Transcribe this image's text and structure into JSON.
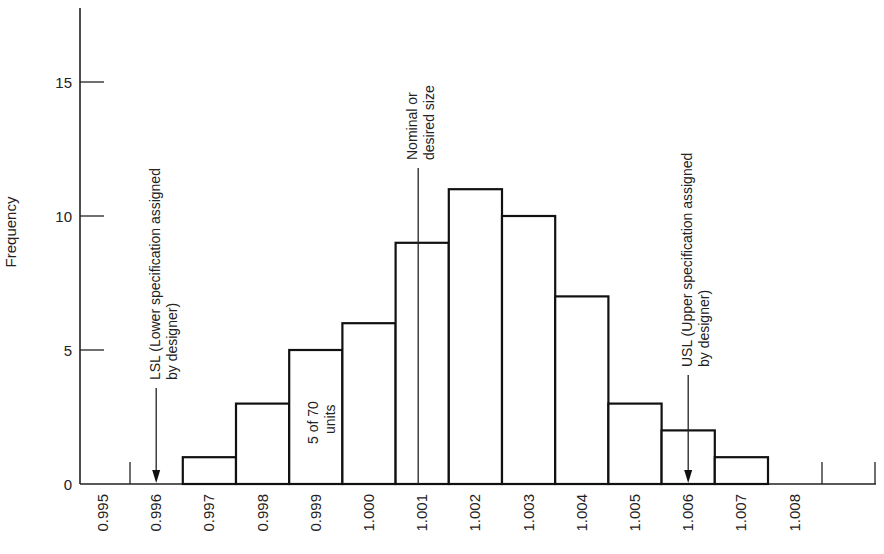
{
  "chart_data": {
    "type": "bar",
    "subtype": "histogram",
    "title": "",
    "xlabel": "",
    "ylabel": "Frequency",
    "ylim": [
      0,
      18
    ],
    "yticks": [
      0,
      5,
      10,
      15
    ],
    "categories": [
      "0.995",
      "0.996",
      "0.997",
      "0.998",
      "0.999",
      "1.000",
      "1.001",
      "1.002",
      "1.003",
      "1.004",
      "1.005",
      "1.006",
      "1.007",
      "1.008"
    ],
    "values": [
      0,
      0,
      1,
      3,
      5,
      6,
      9,
      11,
      10,
      7,
      3,
      2,
      1,
      0
    ],
    "annotations": [
      {
        "id": "lsl",
        "x": "0.996",
        "text_line1": "LSL (Lower specification assigned",
        "text_line2": "by designer)",
        "arrow": "down"
      },
      {
        "id": "nominal",
        "x": "1.001",
        "text_line1": "Nominal or",
        "text_line2": "desired size",
        "line": "vertical"
      },
      {
        "id": "usl",
        "x": "1.006",
        "text_line1": "USL (Upper specification assigned",
        "text_line2": "by designer)",
        "arrow": "down"
      },
      {
        "id": "bar-note",
        "x": "0.999",
        "text_line1": "5 of 70",
        "text_line2": "units"
      }
    ],
    "grid": false,
    "legend": null
  }
}
